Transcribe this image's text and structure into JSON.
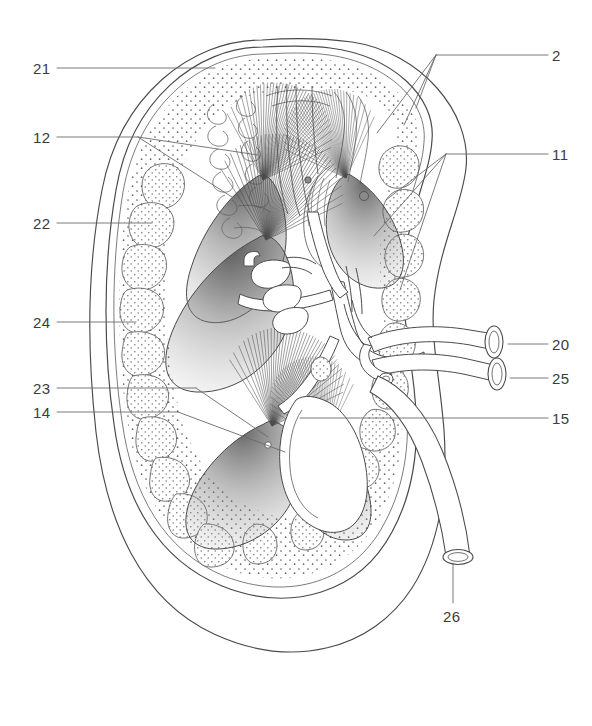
{
  "figure": {
    "view": "longitudinal (coronal) section",
    "style": "patent-style ink line drawing, stippled cortex, striated pyramids",
    "background_color": "#ffffff",
    "line_color": "#3c3c3c",
    "leader_color": "#6b6b6b",
    "label_color": "#3c3c3c",
    "width": 592,
    "height": 726
  },
  "labels": [
    {
      "id": "21",
      "text": "21",
      "side": "left",
      "x": 33,
      "y": 61,
      "leader": {
        "x1": 57,
        "y1": 68,
        "x2": 215,
        "y2": 68
      }
    },
    {
      "id": "12",
      "text": "12",
      "side": "left",
      "x": 33,
      "y": 130,
      "leader": {
        "x1": 57,
        "y1": 137,
        "x2": 138,
        "y2": 137
      }
    },
    {
      "id": "22",
      "text": "22",
      "side": "left",
      "x": 33,
      "y": 216,
      "leader": {
        "x1": 57,
        "y1": 223,
        "x2": 152,
        "y2": 223
      }
    },
    {
      "id": "24",
      "text": "24",
      "side": "left",
      "x": 33,
      "y": 315,
      "leader": {
        "x1": 57,
        "y1": 322,
        "x2": 136,
        "y2": 322
      }
    },
    {
      "id": "23",
      "text": "23",
      "side": "left",
      "x": 33,
      "y": 381,
      "leader": {
        "x1": 57,
        "y1": 388,
        "x2": 196,
        "y2": 388
      }
    },
    {
      "id": "14",
      "text": "14",
      "side": "left",
      "x": 33,
      "y": 405,
      "leader": {
        "x1": 57,
        "y1": 412,
        "x2": 178,
        "y2": 412
      }
    },
    {
      "id": "2",
      "text": "2",
      "side": "right",
      "x": 552,
      "y": 48,
      "leader": {
        "x1": 548,
        "y1": 55,
        "x2": 436,
        "y2": 55
      }
    },
    {
      "id": "11",
      "text": "11",
      "side": "right",
      "x": 552,
      "y": 147,
      "leader": {
        "x1": 548,
        "y1": 154,
        "x2": 446,
        "y2": 154
      }
    },
    {
      "id": "20",
      "text": "20",
      "side": "right",
      "x": 552,
      "y": 337,
      "leader": {
        "x1": 548,
        "y1": 344,
        "x2": 508,
        "y2": 344
      }
    },
    {
      "id": "25",
      "text": "25",
      "side": "right",
      "x": 552,
      "y": 371,
      "leader": {
        "x1": 548,
        "y1": 378,
        "x2": 510,
        "y2": 378
      }
    },
    {
      "id": "15",
      "text": "15",
      "side": "right",
      "x": 552,
      "y": 411,
      "leader": {
        "x1": 548,
        "y1": 418,
        "x2": 300,
        "y2": 418
      }
    },
    {
      "id": "26",
      "text": "26",
      "side": "below",
      "x": 443,
      "y": 609,
      "leader": {
        "x1": 453,
        "y1": 563,
        "x2": 453,
        "y2": 603
      }
    }
  ],
  "leader_branches": [
    {
      "label_id": "12",
      "x1": 138,
      "y1": 137,
      "x2": 232,
      "y2": 197
    },
    {
      "label_id": "12",
      "x1": 138,
      "y1": 137,
      "x2": 258,
      "y2": 155
    },
    {
      "label_id": "2",
      "x1": 436,
      "y1": 55,
      "x2": 377,
      "y2": 133
    },
    {
      "label_id": "2",
      "x1": 436,
      "y1": 55,
      "x2": 404,
      "y2": 125
    },
    {
      "label_id": "2",
      "x1": 436,
      "y1": 55,
      "x2": 416,
      "y2": 108
    },
    {
      "label_id": "11",
      "x1": 446,
      "y1": 154,
      "x2": 386,
      "y2": 200
    },
    {
      "label_id": "11",
      "x1": 446,
      "y1": 154,
      "x2": 374,
      "y2": 236
    },
    {
      "label_id": "11",
      "x1": 446,
      "y1": 154,
      "x2": 400,
      "y2": 290
    },
    {
      "label_id": "23",
      "x1": 196,
      "y1": 388,
      "x2": 268,
      "y2": 437
    },
    {
      "label_id": "14",
      "x1": 178,
      "y1": 412,
      "x2": 285,
      "y2": 452
    }
  ],
  "anatomy_parts": [
    {
      "key": "capsule",
      "name": "renal capsule (outer double contour)"
    },
    {
      "key": "cortex",
      "name": "renal cortex (stippled zone)"
    },
    {
      "key": "pyramid",
      "name": "renal pyramid (striated fan)"
    },
    {
      "key": "column",
      "name": "renal column"
    },
    {
      "key": "papilla",
      "name": "renal papilla"
    },
    {
      "key": "minor-calyx",
      "name": "minor calyx"
    },
    {
      "key": "major-calyx",
      "name": "major calyx"
    },
    {
      "key": "renal-pelvis",
      "name": "renal pelvis"
    },
    {
      "key": "renal-artery",
      "name": "renal artery (cut tube)"
    },
    {
      "key": "renal-vein",
      "name": "renal vein (cut tube)"
    },
    {
      "key": "ureter",
      "name": "ureter (cut tube, lower)"
    },
    {
      "key": "nephron-loops",
      "name": "nephron tubule loops in cortex"
    },
    {
      "key": "kidney-outline",
      "name": "whole kidney bean outline"
    }
  ],
  "chart_data": {
    "type": "diagram",
    "callout_numbers": [
      "2",
      "11",
      "12",
      "14",
      "15",
      "20",
      "21",
      "22",
      "23",
      "24",
      "25",
      "26"
    ],
    "callouts_left": [
      "21",
      "12",
      "22",
      "24",
      "23",
      "14"
    ],
    "callouts_right": [
      "2",
      "11",
      "20",
      "25",
      "15"
    ],
    "callouts_bottom": [
      "26"
    ]
  }
}
